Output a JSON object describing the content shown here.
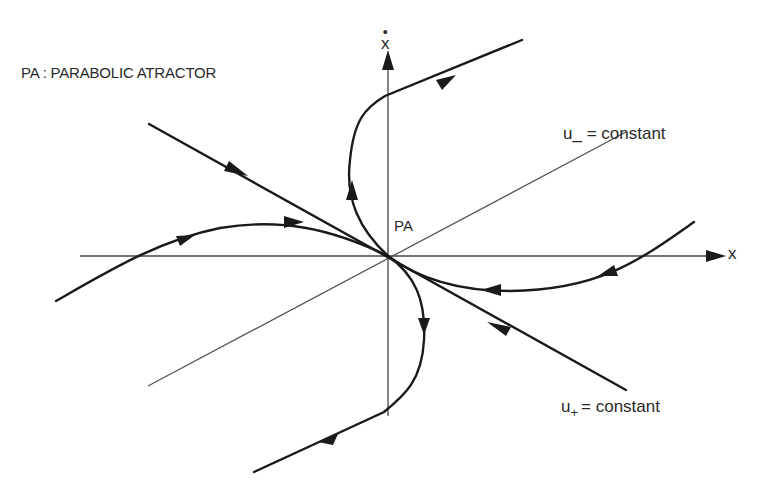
{
  "title": "PA : PARABOLIC ATRACTOR",
  "labels": {
    "origin": "PA",
    "x_axis": "x",
    "y_axis": "x",
    "y_axis_dot": "•",
    "u_minus_var": "u_",
    "u_minus_rest": " = constant",
    "u_plus_var": "u",
    "u_plus_sub": "+",
    "u_plus_rest": "= constant"
  },
  "colors": {
    "background": "#ffffff",
    "lines": "#1a1a1a",
    "axes": "#444444",
    "text": "#2a2a2a"
  },
  "diagram": {
    "type": "phase-portrait",
    "origin_px": [
      388,
      256
    ],
    "axes": [
      {
        "name": "x",
        "from": [
          80,
          256
        ],
        "to": [
          725,
          256
        ]
      },
      {
        "name": "x-dot",
        "from": [
          388,
          415
        ],
        "to": [
          388,
          52
        ]
      }
    ],
    "invariant_lines": [
      {
        "name": "u_minus = constant",
        "style": "thin",
        "from": [
          148,
          386
        ],
        "to": [
          626,
          132
        ]
      },
      {
        "name": "u_plus = constant",
        "style": "thick",
        "from": [
          148,
          124
        ],
        "to": [
          626,
          390
        ]
      }
    ],
    "trajectories": [
      {
        "name": "upper-left-to-top-right",
        "direction": "away from PA"
      },
      {
        "name": "left-curve-into-PA",
        "direction": "toward PA"
      },
      {
        "name": "right-curve-into-PA",
        "direction": "toward PA"
      },
      {
        "name": "lower-curve-away",
        "direction": "away from PA"
      }
    ]
  }
}
